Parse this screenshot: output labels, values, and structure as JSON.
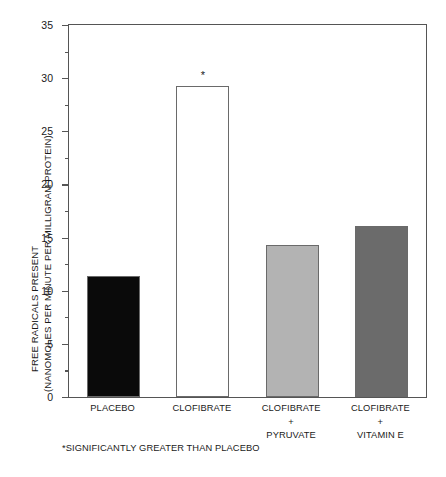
{
  "chart_data": {
    "type": "bar",
    "title": "",
    "xlabel": "",
    "ylabel_line1": "FREE RADICALS PRESENT",
    "ylabel_line2": "(NANOMOLES PER MINUTE PER MILLIGRAM PROTEIN)",
    "categories": [
      "PLACEBO",
      "CLOFIBRATE",
      "CLOFIBRATE + PYRUVATE",
      "CLOFIBRATE + VITAMIN E"
    ],
    "category_lines": [
      [
        "PLACEBO"
      ],
      [
        "CLOFIBRATE"
      ],
      [
        "CLOFIBRATE",
        "+",
        "PYRUVATE"
      ],
      [
        "CLOFIBRATE",
        "+",
        "VITAMIN E"
      ]
    ],
    "values": [
      11.4,
      29.3,
      14.3,
      16.1
    ],
    "bar_colors": [
      "#0a0a0a",
      "#ffffff",
      "#b3b3b3",
      "#6b6b6b"
    ],
    "bar_edge_color": "#6a6a6a",
    "ylim": [
      0,
      35
    ],
    "ytick_major": [
      0,
      5,
      10,
      15,
      20,
      25,
      30,
      35
    ],
    "ytick_major_labels": [
      "0",
      "5",
      "10",
      "15",
      "20",
      "25",
      "30",
      "35"
    ],
    "ytick_minor": [
      2.5,
      7.5,
      12.5,
      17.5,
      22.5,
      27.5,
      32.5
    ],
    "grid": false,
    "legend": "none",
    "annotations": [
      {
        "text": "*",
        "category_index": 1,
        "value": 29.3,
        "meaning": "significantly greater than placebo"
      }
    ],
    "footnote": "*SIGNIFICANTLY GREATER THAN PLACEBO"
  }
}
